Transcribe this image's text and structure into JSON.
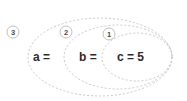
{
  "diagram": {
    "type": "nested-ellipse-scope-diagram",
    "background_color": "#ffffff",
    "stroke_color": "#c9c9c9",
    "text_color": "#2b2b2b",
    "badge_text_color": "#4a4a4a",
    "expression": "a = b = c = 5",
    "groups": [
      {
        "badge": "3",
        "badge_cx": 13,
        "badge_cy": 32,
        "badge_r": 6,
        "ellipse_cx": 100,
        "ellipse_cy": 57,
        "ellipse_rx": 72,
        "ellipse_ry": 39
      },
      {
        "badge": "2",
        "badge_cx": 66,
        "badge_cy": 32,
        "badge_r": 6,
        "ellipse_cx": 118,
        "ellipse_cy": 57,
        "ellipse_rx": 54,
        "ellipse_ry": 32
      },
      {
        "badge": "1",
        "badge_cx": 109,
        "badge_cy": 34,
        "badge_r": 6,
        "ellipse_cx": 137,
        "ellipse_cy": 57,
        "ellipse_rx": 35,
        "ellipse_ry": 24
      }
    ],
    "terms": [
      {
        "label": "a =",
        "x": 33,
        "y": 57
      },
      {
        "label": "b =",
        "x": 79,
        "y": 57
      },
      {
        "label": "c = 5",
        "x": 117,
        "y": 57
      }
    ]
  }
}
